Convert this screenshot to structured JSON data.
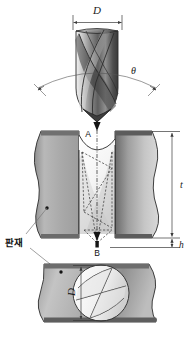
{
  "figure": {
    "background_color": "#ffffff",
    "labels": {
      "diameter_top": "D",
      "point_angle": "θ",
      "entry_point": "A",
      "exit_point": "B",
      "thickness": "t",
      "burr_height": "h",
      "workpiece_ko": "판재",
      "diameter_bottom": "D"
    },
    "colors": {
      "metal_light": "#d6d6d6",
      "metal_mid": "#a9a9a9",
      "metal_dark": "#6f6f6f",
      "metal_darkest": "#4a4a4a",
      "outline": "#2b2b2b",
      "dimension": "#3a3a3a",
      "leader": "#777777",
      "hole_fill": "#ffffff",
      "text": "#111111"
    },
    "views": [
      {
        "name": "drill-bit-view",
        "description": "Twist drill bit with two helical flutes, point angle theta, shank diameter D"
      },
      {
        "name": "section-view",
        "description": "Plate cross-section with drill axis, entry point A at top surface, exit point B below bottom surface, plate thickness t, burr height h"
      },
      {
        "name": "plan-view",
        "description": "Plan view of plate showing drilled circular hole of diameter D with drill point geometry"
      }
    ]
  }
}
